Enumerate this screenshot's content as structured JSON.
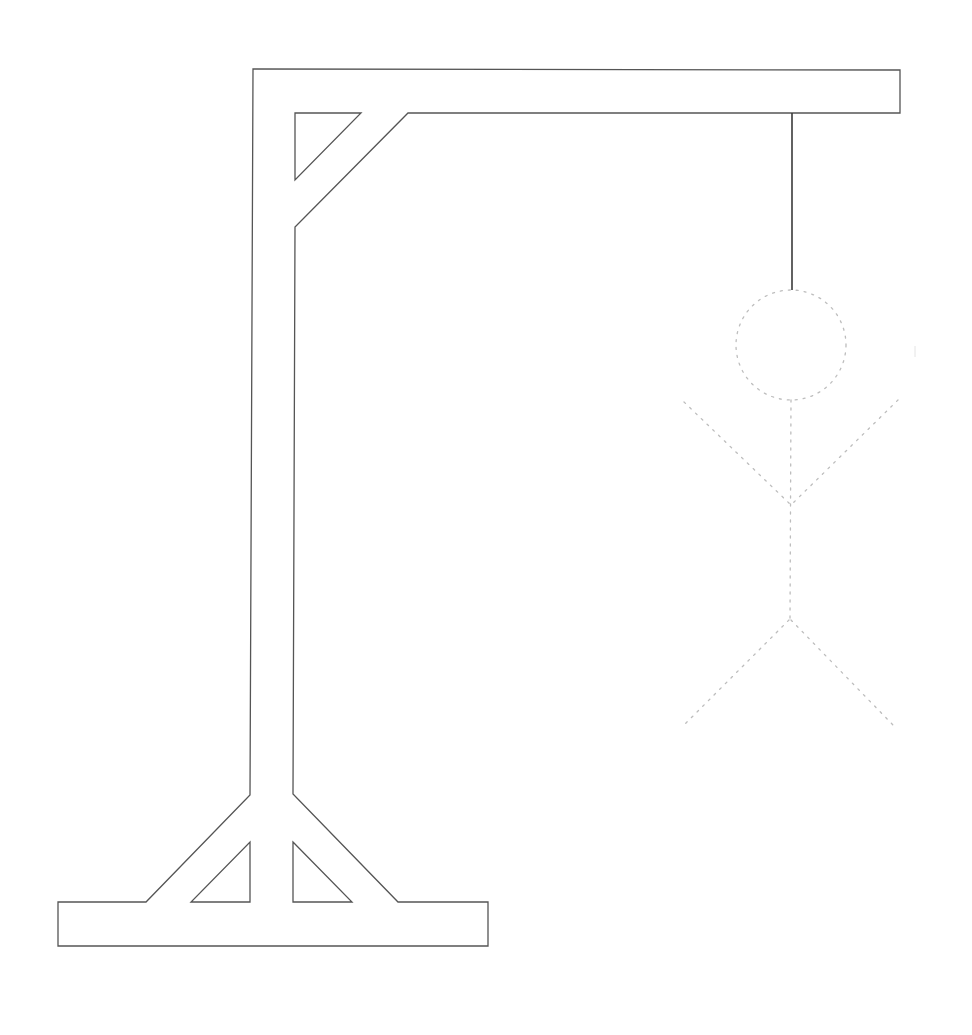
{
  "game": {
    "name": "Hangman",
    "drawing": "gallows-with-hanged-figure",
    "colors": {
      "background": "#ffffff",
      "gallows_stroke": "#555555",
      "rope_stroke": "#3a3a3a",
      "figure_stroke": "#bdbdbd"
    },
    "figure_parts": [
      {
        "part": "head",
        "state": "dotted-outline"
      },
      {
        "part": "torso",
        "state": "dotted-outline"
      },
      {
        "part": "left-arm",
        "state": "dotted-outline"
      },
      {
        "part": "right-arm",
        "state": "dotted-outline"
      },
      {
        "part": "left-leg",
        "state": "dotted-outline"
      },
      {
        "part": "right-leg",
        "state": "dotted-outline"
      }
    ]
  }
}
